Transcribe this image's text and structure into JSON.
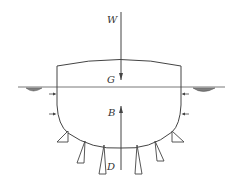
{
  "diagram": {
    "type": "floating-structure-force-diagram",
    "labels": {
      "weight": "W",
      "center_of_gravity": "G",
      "center_of_buoyancy": "B",
      "drag_or_pressure": "D"
    },
    "elements": {
      "hull": "floating body cross-section with curved deck and rounded bottom",
      "waterline": "horizontal water surface line",
      "weight_arrow": "downward arrow W at G",
      "buoyancy_arrow": "upward arrow B",
      "side_pressure_arrows": 4,
      "bottom_pressure_wedges": 6,
      "water_hatch_marks": 2
    },
    "colors": {
      "stroke": "#444444",
      "background": "#ffffff"
    }
  }
}
